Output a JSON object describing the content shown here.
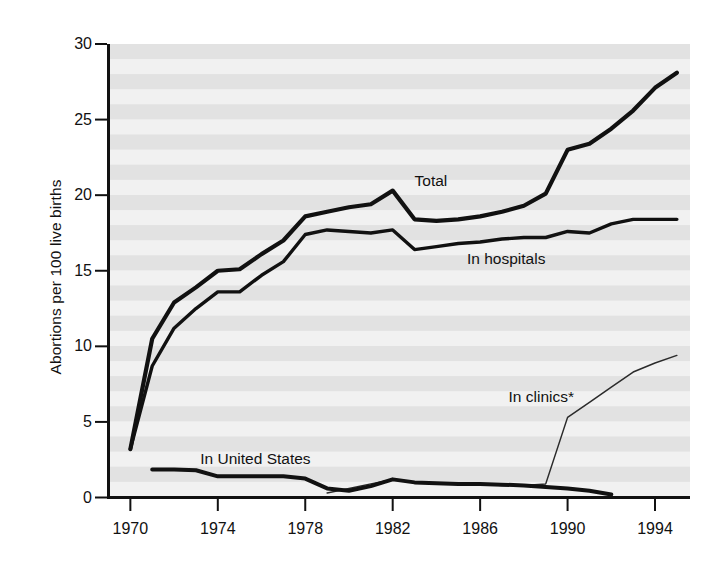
{
  "chart_data": {
    "type": "line",
    "title": "",
    "subtitle": "",
    "xlabel": "",
    "ylabel": "Abortions per 100 live births",
    "xlim": [
      1969,
      1995.6
    ],
    "ylim": [
      0,
      30
    ],
    "grid": false,
    "grid_note": "background rendered as horizontal alternating gray halftone bands",
    "legend_position": "inline-annotations",
    "xticks": [
      1970,
      1974,
      1978,
      1982,
      1986,
      1990,
      1994
    ],
    "xtick_labels": [
      "1970",
      "1974",
      "1978",
      "1982",
      "1986",
      "1990",
      "1994"
    ],
    "yticks": [
      0,
      5,
      10,
      15,
      20,
      25,
      30
    ],
    "ytick_labels": [
      "0",
      "5",
      "10",
      "15",
      "20",
      "25",
      "30"
    ],
    "footnote_marker": "*",
    "series": [
      {
        "name": "Total",
        "label": "Total",
        "color": "#111111",
        "width": 4.2,
        "label_x": 1983.0,
        "label_y": 20.9,
        "x": [
          1970,
          1971,
          1972,
          1973,
          1974,
          1975,
          1976,
          1977,
          1978,
          1979,
          1980,
          1981,
          1982,
          1983,
          1984,
          1985,
          1986,
          1987,
          1988,
          1989,
          1990,
          1991,
          1992,
          1993,
          1994,
          1995
        ],
        "values": [
          3.2,
          10.5,
          12.9,
          13.9,
          15.0,
          15.1,
          16.1,
          17.0,
          18.6,
          18.9,
          19.2,
          19.4,
          20.3,
          18.4,
          18.3,
          18.4,
          18.6,
          18.9,
          19.3,
          20.1,
          23.0,
          23.4,
          24.4,
          25.6,
          27.1,
          28.1
        ]
      },
      {
        "name": "In hospitals",
        "label": "In hospitals",
        "color": "#111111",
        "width": 3.4,
        "label_x": 1985.4,
        "label_y": 15.7,
        "x": [
          1970,
          1971,
          1972,
          1973,
          1974,
          1975,
          1976,
          1977,
          1978,
          1979,
          1980,
          1981,
          1982,
          1983,
          1984,
          1985,
          1986,
          1987,
          1988,
          1989,
          1990,
          1991,
          1992,
          1993,
          1994,
          1995
        ],
        "values": [
          3.2,
          8.7,
          11.2,
          12.5,
          13.6,
          13.6,
          14.7,
          15.6,
          17.4,
          17.7,
          17.6,
          17.5,
          17.7,
          16.4,
          16.6,
          16.8,
          16.9,
          17.1,
          17.2,
          17.2,
          17.6,
          17.5,
          18.1,
          18.4,
          18.4,
          18.4
        ]
      },
      {
        "name": "In clinics*",
        "label": "In clinics*",
        "color": "#2b2b2b",
        "width": 1.5,
        "label_x": 1987.3,
        "label_y": 6.6,
        "x": [
          1979,
          1980,
          1981,
          1982,
          1983,
          1984,
          1985,
          1986,
          1987,
          1988,
          1989,
          1990,
          1991,
          1992,
          1993,
          1994,
          1995
        ],
        "values": [
          0.3,
          0.6,
          0.9,
          1.2,
          1.0,
          0.9,
          0.9,
          0.9,
          0.8,
          0.8,
          0.9,
          5.3,
          6.3,
          7.3,
          8.3,
          8.9,
          9.4
        ]
      },
      {
        "name": "In United States",
        "label": "In United States",
        "color": "#111111",
        "width": 4.0,
        "label_x": 1973.2,
        "label_y": 2.45,
        "x": [
          1971,
          1972,
          1973,
          1974,
          1975,
          1976,
          1977,
          1978,
          1979,
          1980,
          1981,
          1982,
          1983,
          1984,
          1985,
          1986,
          1987,
          1988,
          1989,
          1990,
          1991,
          1992
        ],
        "values": [
          1.85,
          1.85,
          1.8,
          1.4,
          1.4,
          1.4,
          1.4,
          1.25,
          0.6,
          0.45,
          0.75,
          1.2,
          1.0,
          0.95,
          0.9,
          0.9,
          0.85,
          0.8,
          0.7,
          0.6,
          0.45,
          0.2
        ]
      }
    ]
  },
  "axes": {
    "ylabel_text": "Abortions per 100 live births"
  }
}
